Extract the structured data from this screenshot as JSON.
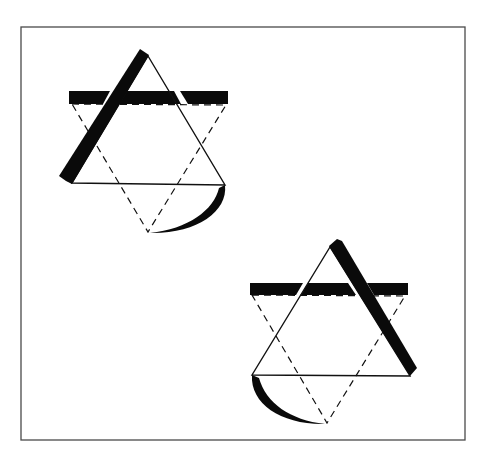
{
  "diagram": {
    "title": "",
    "frame": {
      "x": 21,
      "y": 27,
      "width": 444,
      "height": 413,
      "stroke": "#4a4a4a"
    },
    "colors": {
      "ink": "#0a0a0a",
      "background": "#ffffff"
    },
    "figures": [
      {
        "id": "figure-top-left",
        "solid_triangle": {
          "apex": [
            148,
            56
          ],
          "bottom_left": [
            72,
            183
          ],
          "bottom_right": [
            225,
            185
          ]
        },
        "thick_slanted_bar": {
          "side": "left",
          "from": [
            140,
            50
          ],
          "to": [
            62,
            180
          ],
          "width": 9
        },
        "horizontal_bar": {
          "x1": 69,
          "x2": 228,
          "y_top": 91,
          "y_bottom": 104
        },
        "dashed_triangle": {
          "top_left": [
            72,
            104
          ],
          "top_right": [
            226,
            105
          ],
          "bottom_apex": [
            148,
            232
          ]
        },
        "crescent": {
          "from": [
            225,
            185
          ],
          "to": [
            150,
            233
          ],
          "side": "right"
        }
      },
      {
        "id": "figure-bottom-right",
        "solid_triangle": {
          "apex": [
            330,
            247
          ],
          "bottom_left": [
            252,
            375
          ],
          "bottom_right": [
            410,
            376
          ]
        },
        "thick_slanted_bar": {
          "side": "right",
          "from": [
            337,
            240
          ],
          "to": [
            416,
            372
          ],
          "width": 9
        },
        "horizontal_bar": {
          "x1": 250,
          "x2": 408,
          "y_top": 283,
          "y_bottom": 295
        },
        "dashed_triangle": {
          "top_left": [
            252,
            295
          ],
          "top_right": [
            405,
            296
          ],
          "bottom_apex": [
            327,
            423
          ]
        },
        "crescent": {
          "from": [
            252,
            375
          ],
          "to": [
            325,
            424
          ],
          "side": "left"
        }
      }
    ]
  }
}
